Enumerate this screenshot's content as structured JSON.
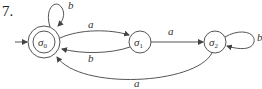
{
  "figure": {
    "number": "7.",
    "type": "finite-state automaton"
  },
  "states": [
    {
      "id": "s0",
      "label": "σ",
      "subscript": "0",
      "initial": true,
      "accepting": true
    },
    {
      "id": "s1",
      "label": "σ",
      "subscript": "1",
      "initial": false,
      "accepting": false
    },
    {
      "id": "s2",
      "label": "σ",
      "subscript": "2",
      "initial": false,
      "accepting": false
    }
  ],
  "transitions": [
    {
      "from": "s0",
      "to": "s0",
      "label": "b"
    },
    {
      "from": "s0",
      "to": "s1",
      "label": "a"
    },
    {
      "from": "s1",
      "to": "s0",
      "label": "b"
    },
    {
      "from": "s1",
      "to": "s2",
      "label": "a"
    },
    {
      "from": "s2",
      "to": "s2",
      "label": "b"
    },
    {
      "from": "s2",
      "to": "s0",
      "label": "a"
    }
  ],
  "colors": {
    "stroke": "#555555",
    "text": "#333333"
  }
}
